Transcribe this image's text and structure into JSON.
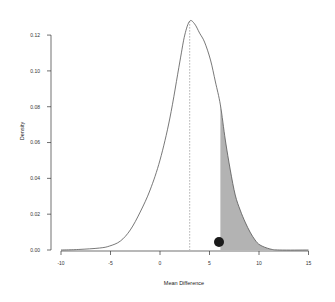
{
  "chart_data": {
    "type": "area",
    "title": "",
    "xlabel": "Mean Difference",
    "ylabel": "Density",
    "xlim": [
      -10,
      15
    ],
    "ylim": [
      0,
      0.12
    ],
    "x_ticks": [
      "-10",
      "-5",
      "0",
      "5",
      "10",
      "15"
    ],
    "y_ticks": [
      "0.00",
      "0.02",
      "0.04",
      "0.06",
      "0.08",
      "0.10",
      "0.12"
    ],
    "grid": false,
    "legend": null,
    "series": [
      {
        "name": "density",
        "x": [
          -10,
          -8.2,
          -6.1,
          -5.1,
          -4.0,
          -3.0,
          -2.0,
          -1.0,
          0.0,
          1.0,
          2.0,
          2.5,
          3.0,
          3.5,
          4.0,
          4.5,
          5.1,
          5.6,
          6.1,
          6.6,
          7.1,
          7.6,
          8.1,
          8.6,
          9.1,
          9.6,
          10.1,
          11.1,
          12.1,
          15.0
        ],
        "y": [
          0.0,
          0.0003,
          0.0011,
          0.0022,
          0.005,
          0.0112,
          0.0212,
          0.0335,
          0.0502,
          0.0737,
          0.105,
          0.12,
          0.1278,
          0.1262,
          0.1211,
          0.1161,
          0.1061,
          0.0938,
          0.081,
          0.0614,
          0.0447,
          0.0307,
          0.0223,
          0.0156,
          0.01,
          0.0056,
          0.0028,
          0.0006,
          0.0,
          0.0
        ]
      }
    ],
    "annotations": [
      {
        "type": "vline",
        "x": 3.0,
        "style": "dashed",
        "label": "mean"
      },
      {
        "type": "shaded_region",
        "x_from": 6.1,
        "x_to": 15,
        "color": "#b3b3b3"
      },
      {
        "type": "point",
        "x": 6.0,
        "y": 0.0045,
        "color": "#1a1a1a"
      }
    ]
  },
  "colors": {
    "curve": "#555555",
    "shade": "#b3b3b3",
    "point": "#1a1a1a",
    "axis": "#333333"
  }
}
